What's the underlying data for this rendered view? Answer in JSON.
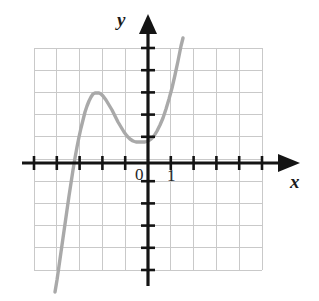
{
  "figure": {
    "kind": "coordinate-grid-graph",
    "width": 319,
    "height": 301,
    "background_color": "#ffffff"
  },
  "labels": {
    "y_axis": "y",
    "x_axis": "x",
    "origin": "0",
    "x_unit": "1"
  },
  "colors": {
    "grid": "#c9c9c9",
    "axis": "#141414",
    "curve": "#a9a9a9",
    "text": "#1a1a1a"
  },
  "chart_data": {
    "type": "line",
    "title": "",
    "xlabel": "x",
    "ylabel": "y",
    "grid": true,
    "legend": false,
    "axis_arrows": [
      "x-positive",
      "y-positive"
    ],
    "origin_px": [
      148,
      163
    ],
    "unit_px": 23,
    "xlim": [
      -5,
      5
    ],
    "ylim": [
      -4.65,
      5
    ],
    "x_ticks": [
      -5,
      -4,
      -3,
      -2,
      -1,
      0,
      1,
      2,
      3,
      4,
      5
    ],
    "y_ticks": [
      -4,
      -3,
      -2,
      -1,
      0,
      1,
      2,
      3,
      4,
      5
    ],
    "tick_labels_shown": [
      "0",
      "1"
    ],
    "grid_extent_px": {
      "left": 34,
      "top": 48,
      "right": 262,
      "bottom": 270
    },
    "grid_columns": 10,
    "grid_rows": 10,
    "curve_description": "cubic-like curve rising from lower left, local maximum near x=-2.25, local minimum near x=-0.13, then rising steeply",
    "features": {
      "x_intercept": -3.65,
      "local_maximum": {
        "x": -2.26,
        "y": 3.04
      },
      "local_minimum": {
        "x": -0.13,
        "y": 0.91
      },
      "y_intercept": 0.95
    },
    "curve_points_px": [
      [
        55,
        292
      ],
      [
        57,
        280
      ],
      [
        59,
        266
      ],
      [
        61,
        252
      ],
      [
        63,
        238
      ],
      [
        65,
        224
      ],
      [
        67,
        210
      ],
      [
        69,
        196
      ],
      [
        71,
        183
      ],
      [
        73,
        170
      ],
      [
        75,
        158
      ],
      [
        77,
        147
      ],
      [
        79,
        137
      ],
      [
        81,
        128
      ],
      [
        83,
        120
      ],
      [
        85,
        112
      ],
      [
        87,
        106
      ],
      [
        89,
        101
      ],
      [
        91,
        97
      ],
      [
        93,
        94
      ],
      [
        95,
        93
      ],
      [
        97,
        93
      ],
      [
        99,
        93
      ],
      [
        101,
        94
      ],
      [
        103,
        96
      ],
      [
        106,
        100
      ],
      [
        109,
        105
      ],
      [
        112,
        110
      ],
      [
        115,
        116
      ],
      [
        118,
        122
      ],
      [
        121,
        127
      ],
      [
        124,
        132
      ],
      [
        127,
        136
      ],
      [
        130,
        139
      ],
      [
        133,
        141
      ],
      [
        136,
        142
      ],
      [
        139,
        142
      ],
      [
        142,
        142
      ],
      [
        145,
        142
      ],
      [
        148,
        141
      ],
      [
        151,
        139
      ],
      [
        154,
        136
      ],
      [
        157,
        131
      ],
      [
        160,
        125
      ],
      [
        163,
        118
      ],
      [
        166,
        109
      ],
      [
        169,
        99
      ],
      [
        172,
        88
      ],
      [
        175,
        75
      ],
      [
        178,
        61
      ],
      [
        181,
        46
      ],
      [
        183,
        38
      ]
    ]
  }
}
